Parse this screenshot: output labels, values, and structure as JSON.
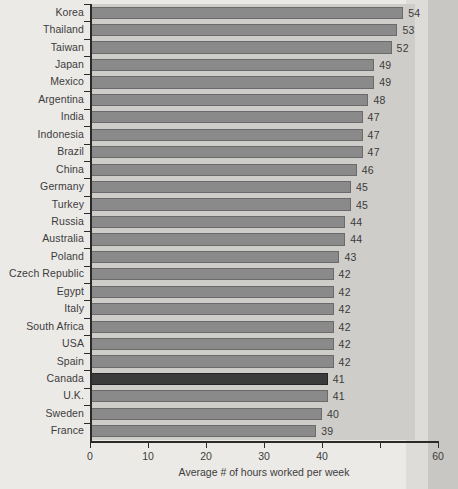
{
  "chart_data": {
    "type": "bar",
    "orientation": "horizontal",
    "title": "",
    "xlabel": "Average # of hours worked per week",
    "ylabel": "",
    "xlim": [
      0,
      60
    ],
    "grid": false,
    "legend": null,
    "xticks": [
      {
        "value": 0,
        "label": "0"
      },
      {
        "value": 10,
        "label": "10"
      },
      {
        "value": 20,
        "label": "20"
      },
      {
        "value": 30,
        "label": "30"
      },
      {
        "value": 40,
        "label": "40"
      },
      {
        "value": 50,
        "label": ""
      },
      {
        "value": 60,
        "label": "60"
      }
    ],
    "categories": [
      "Korea",
      "Thailand",
      "Taiwan",
      "Japan",
      "Mexico",
      "Argentina",
      "India",
      "Indonesia",
      "Brazil",
      "China",
      "Germany",
      "Turkey",
      "Russia",
      "Australia",
      "Poland",
      "Czech Republic",
      "Egypt",
      "Italy",
      "South Africa",
      "USA",
      "Spain",
      "Canada",
      "U.K.",
      "Sweden",
      "France"
    ],
    "values": [
      54,
      53,
      52,
      49,
      49,
      48,
      47,
      47,
      47,
      46,
      45,
      45,
      44,
      44,
      43,
      42,
      42,
      42,
      42,
      42,
      42,
      41,
      41,
      40,
      39
    ],
    "value_labels": [
      "54",
      "53",
      "52",
      "49",
      "49",
      "48",
      "47",
      "47",
      "47",
      "46",
      "45",
      "45",
      "44",
      "44",
      "43",
      "42",
      "42",
      "42",
      "42",
      "42",
      "42",
      "41",
      "41",
      "40",
      "39"
    ],
    "highlighted_category": "Canada",
    "colors": {
      "bar": "#8a8a8a",
      "bar_border": "#6a6a6a",
      "highlight_bar": "#3b3b3b",
      "highlight_bar_border": "#262626",
      "plot_background": "#cfcdc9",
      "page_background": "#eceae7",
      "axis": "#2a2a2a",
      "text": "#3c3c3c"
    }
  }
}
